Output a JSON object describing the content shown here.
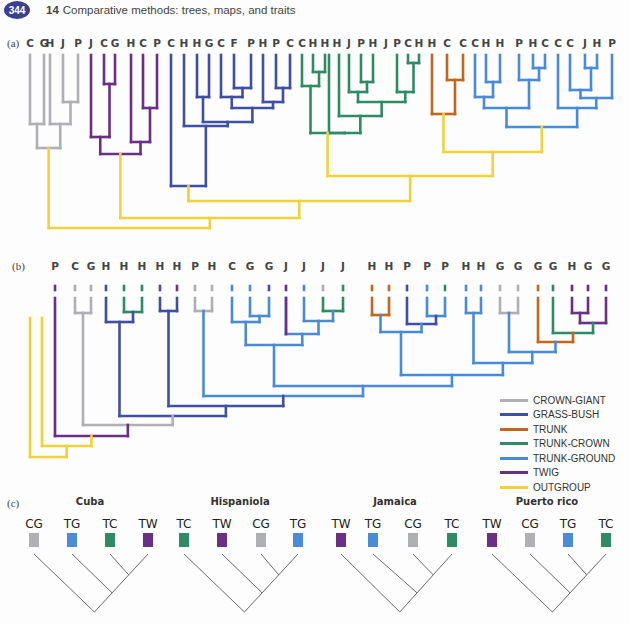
{
  "header": {
    "page_number": "344",
    "chapter_number": "14",
    "chapter_title": "Comparative methods: trees, maps, and traits"
  },
  "colors": {
    "crown_giant": "#aeb0b4",
    "grass_bush": "#3f4fa3",
    "trunk": "#c4661f",
    "trunk_crown": "#2f8a66",
    "trunk_ground": "#4a8bd8",
    "twig": "#6b2f86",
    "outgroup": "#f2d23a"
  },
  "panel_a": {
    "label": "(a)",
    "tips": [
      "C",
      "G",
      "H",
      "J",
      "P",
      "J",
      "C",
      "G",
      "H",
      "C",
      "P",
      "C",
      "H",
      "H",
      "G",
      "C",
      "F",
      "P",
      "H",
      "P",
      "C",
      "C",
      "H",
      "H",
      "H",
      "J",
      "P",
      "H",
      "J",
      "P",
      "C",
      "H",
      "H",
      "C",
      "C",
      "C",
      "H",
      "H",
      "P",
      "H",
      "C",
      "C",
      "C",
      "J",
      "H",
      "P"
    ]
  },
  "panel_b": {
    "label": "(b)",
    "tips": [
      "P",
      "C",
      "G",
      "H",
      "H",
      "H",
      "H",
      "H",
      "P",
      "H",
      "C",
      "G",
      "G",
      "J",
      "J",
      "J",
      "J",
      "H",
      "H",
      "P",
      "P",
      "P",
      "H",
      "H",
      "G",
      "G",
      "G",
      "G",
      "H",
      "G",
      "G"
    ]
  },
  "legend": {
    "items": [
      {
        "label": "CROWN-GIANT",
        "color": "#aeb0b4"
      },
      {
        "label": "GRASS-BUSH",
        "color": "#3f4fa3"
      },
      {
        "label": "TRUNK",
        "color": "#c4661f"
      },
      {
        "label": "TRUNK-CROWN",
        "color": "#2f8a66"
      },
      {
        "label": "TRUNK-GROUND",
        "color": "#4a8bd8"
      },
      {
        "label": "TWIG",
        "color": "#6b2f86"
      },
      {
        "label": "OUTGROUP",
        "color": "#f2d23a"
      }
    ]
  },
  "panel_c": {
    "label": "(c)",
    "islands": [
      {
        "name": "Cuba",
        "tips": [
          "CG",
          "TG",
          "TC",
          "TW"
        ]
      },
      {
        "name": "Hispaniola",
        "tips": [
          "TC",
          "TW",
          "CG",
          "TG"
        ]
      },
      {
        "name": "Jamaica",
        "tips": [
          "TW",
          "TG",
          "CG",
          "TC"
        ]
      },
      {
        "name": "Puerto rico",
        "tips": [
          "TW",
          "CG",
          "TG",
          "TC"
        ]
      }
    ]
  }
}
